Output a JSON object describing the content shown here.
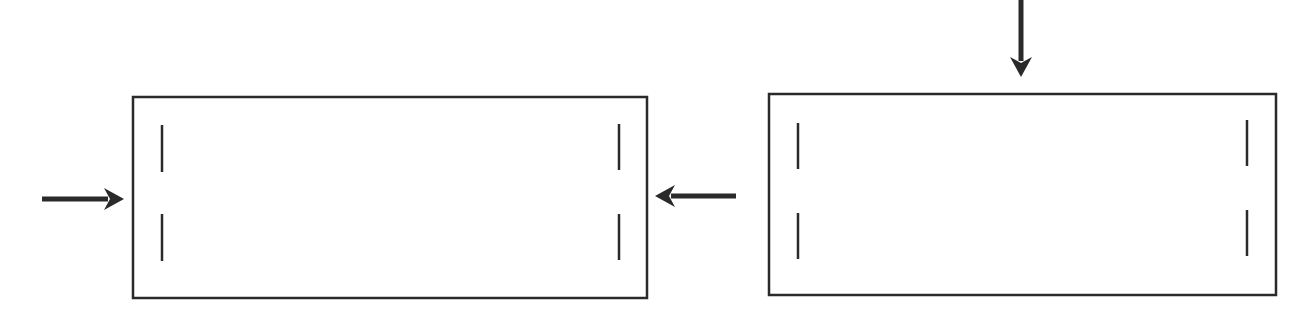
{
  "diagram": {
    "width": 1311,
    "height": 323,
    "stroke_color": "#2a2a2a",
    "background": "#ffffff",
    "panels": [
      {
        "name": "left-panel",
        "x": 133,
        "y": 97,
        "w": 514,
        "h": 201,
        "slots": [
          {
            "x": 162,
            "y1": 125,
            "y2": 172
          },
          {
            "x": 162,
            "y1": 214,
            "y2": 261
          },
          {
            "x": 619,
            "y1": 124,
            "y2": 170
          },
          {
            "x": 619,
            "y1": 214,
            "y2": 260
          }
        ]
      },
      {
        "name": "right-panel",
        "x": 769,
        "y": 94,
        "w": 507,
        "h": 201,
        "slots": [
          {
            "x": 798,
            "y1": 123,
            "y2": 169
          },
          {
            "x": 798,
            "y1": 213,
            "y2": 259
          },
          {
            "x": 1247,
            "y1": 120,
            "y2": 166
          },
          {
            "x": 1247,
            "y1": 210,
            "y2": 256
          }
        ]
      }
    ],
    "arrows": [
      {
        "name": "arrow-right-into-left-panel",
        "direction": "right",
        "x1": 42,
        "y1": 199,
        "x2": 124,
        "y2": 199
      },
      {
        "name": "arrow-left-into-left-panel",
        "direction": "left",
        "x1": 736,
        "y1": 196,
        "x2": 655,
        "y2": 196
      },
      {
        "name": "arrow-down-into-right-panel",
        "direction": "down",
        "x1": 1021,
        "y1": 0,
        "x2": 1021,
        "y2": 77
      }
    ]
  }
}
